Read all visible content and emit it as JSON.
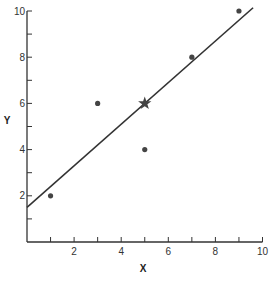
{
  "chart_data": {
    "type": "scatter",
    "title": "",
    "xlabel": "X",
    "ylabel": "Y",
    "xlim": [
      0,
      10
    ],
    "ylim": [
      0,
      10
    ],
    "grid": false,
    "x_ticks": [
      2,
      4,
      6,
      8,
      10
    ],
    "x_minor_ticks": [
      1,
      3,
      5,
      7,
      9
    ],
    "y_ticks": [
      2,
      4,
      6,
      8,
      10
    ],
    "y_minor_ticks": [
      1,
      3,
      5,
      7,
      9
    ],
    "series": [
      {
        "name": "data points",
        "marker": "circle",
        "points": [
          {
            "x": 1,
            "y": 2
          },
          {
            "x": 3,
            "y": 6
          },
          {
            "x": 5,
            "y": 4
          },
          {
            "x": 7,
            "y": 8
          },
          {
            "x": 9,
            "y": 10
          }
        ]
      },
      {
        "name": "mean point",
        "marker": "star",
        "points": [
          {
            "x": 5,
            "y": 6
          }
        ]
      }
    ],
    "regression_line": {
      "intercept": 1.5,
      "slope": 0.9,
      "x_range": [
        0,
        9.6
      ]
    }
  },
  "colors": {
    "axis": "#333333",
    "line": "#333333",
    "marker": "#444444"
  }
}
